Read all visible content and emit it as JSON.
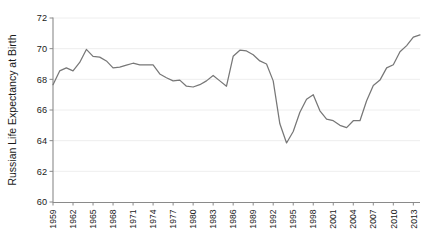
{
  "chart_data": {
    "type": "line",
    "title": "",
    "xlabel": "",
    "ylabel": "Russian Life Expectancy at Birth",
    "ylim": [
      60,
      72
    ],
    "xlim": [
      1959,
      2014
    ],
    "yticks": [
      60,
      62,
      64,
      66,
      68,
      70,
      72
    ],
    "ytick_labels": [
      "60",
      "62",
      "64",
      "66",
      "68",
      "70",
      "72"
    ],
    "xticks": [
      1959,
      1962,
      1965,
      1968,
      1971,
      1974,
      1977,
      1980,
      1983,
      1986,
      1989,
      1992,
      1995,
      1998,
      2001,
      2004,
      2007,
      2010,
      2013
    ],
    "xtick_labels": [
      "1959",
      "1962",
      "1965",
      "1968",
      "1971",
      "1974",
      "1977",
      "1980",
      "1983",
      "1986",
      "1989",
      "1992",
      "1995",
      "1998",
      "2001",
      "2004",
      "2007",
      "2010",
      "2013"
    ],
    "grid": true,
    "grid_axis": "y",
    "legend": false,
    "line_color": "#777777",
    "grid_color": "#ececec",
    "axis_color": "#8a8a8a",
    "x": [
      1959,
      1960,
      1961,
      1962,
      1963,
      1964,
      1965,
      1966,
      1967,
      1968,
      1969,
      1970,
      1971,
      1972,
      1973,
      1974,
      1975,
      1976,
      1977,
      1978,
      1979,
      1980,
      1981,
      1982,
      1983,
      1984,
      1985,
      1986,
      1987,
      1988,
      1989,
      1990,
      1991,
      1992,
      1993,
      1994,
      1995,
      1996,
      1997,
      1998,
      1999,
      2000,
      2001,
      2002,
      2003,
      2004,
      2005,
      2006,
      2007,
      2008,
      2009,
      2010,
      2011,
      2012,
      2013,
      2014
    ],
    "values": [
      67.65,
      68.55,
      68.75,
      68.55,
      69.1,
      69.95,
      69.5,
      69.45,
      69.2,
      68.75,
      68.8,
      68.93,
      69.05,
      68.95,
      68.95,
      68.95,
      68.35,
      68.1,
      67.9,
      67.95,
      67.55,
      67.5,
      67.65,
      67.9,
      68.25,
      67.9,
      67.55,
      69.5,
      69.9,
      69.85,
      69.6,
      69.2,
      69.0,
      67.9,
      65.1,
      63.85,
      64.6,
      65.85,
      66.7,
      67.0,
      65.95,
      65.4,
      65.3,
      65.0,
      64.85,
      65.3,
      65.3,
      66.6,
      67.6,
      67.95,
      68.75,
      68.95,
      69.8,
      70.2,
      70.75,
      70.9
    ]
  }
}
